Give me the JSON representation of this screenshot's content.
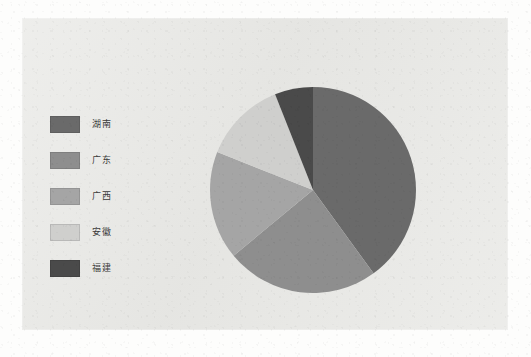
{
  "chart_data": {
    "type": "pie",
    "title": "",
    "xlabel": "",
    "ylabel": "",
    "legend_position": "left",
    "grid": false,
    "start_angle_deg": 0,
    "direction": "clockwise",
    "categories": [
      "湖南",
      "广东",
      "广西",
      "安徽",
      "福建"
    ],
    "values": [
      40,
      24,
      17,
      13,
      6
    ],
    "colors": [
      "#6a6a6a",
      "#8e8e8e",
      "#a5a5a5",
      "#cfcfcd",
      "#4a4a4a"
    ],
    "series": [
      {
        "name": "分布",
        "values": [
          40,
          24,
          17,
          13,
          6
        ]
      }
    ],
    "slices": [
      {
        "label": "湖南",
        "value": 40,
        "color": "#6a6a6a",
        "start_deg": 60,
        "end_deg": 360
      },
      {
        "label": "广东",
        "value": 24,
        "color": "#8e8e8e",
        "start_deg": 275,
        "end_deg": 60
      },
      {
        "label": "广西",
        "value": 17,
        "color": "#a5a5a5",
        "start_deg": 68,
        "end_deg": 129
      },
      {
        "label": "安徽",
        "value": 13,
        "color": "#cfcfcd",
        "start_deg": 21,
        "end_deg": 68
      },
      {
        "label": "福建",
        "value": 6,
        "color": "#4a4a4a",
        "start_deg": 0,
        "end_deg": 21
      }
    ]
  },
  "legend": {
    "items": [
      {
        "label": "湖南",
        "color": "#6a6a6a"
      },
      {
        "label": "广东",
        "color": "#8e8e8e"
      },
      {
        "label": "广西",
        "color": "#a5a5a5"
      },
      {
        "label": "安徽",
        "color": "#cfcfcd"
      },
      {
        "label": "福建",
        "color": "#4a4a4a"
      }
    ]
  },
  "panel": {
    "background_color": "#e9e9e6"
  },
  "geometry": {
    "center_x": 291,
    "center_y": 172,
    "radius": 103
  }
}
